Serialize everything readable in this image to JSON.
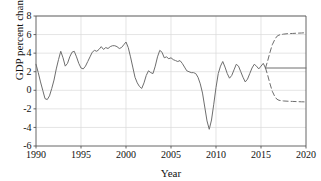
{
  "chart_data": {
    "type": "line",
    "title": "",
    "xlabel": "Year",
    "ylabel": "GDP percent change",
    "xlim": [
      1990,
      2020
    ],
    "ylim": [
      -6,
      8
    ],
    "xticks": [
      1990,
      1995,
      2000,
      2005,
      2010,
      2015,
      2020
    ],
    "yticks": [
      -6,
      -4,
      -2,
      0,
      2,
      4,
      6,
      8
    ],
    "xtick_labels": [
      "1990",
      "1995",
      "2000",
      "2005",
      "2010",
      "2015",
      "2020"
    ],
    "ytick_labels": [
      "-6",
      "-4",
      "-2",
      "0",
      "2",
      "4",
      "6",
      "8"
    ],
    "grid": true,
    "legend": "none",
    "series": [
      {
        "name": "historical-gdp-percent-change",
        "style": "solid",
        "color": "#6e6e6e",
        "x": [
          1990.0,
          1990.25,
          1990.5,
          1990.75,
          1991.0,
          1991.25,
          1991.5,
          1991.75,
          1992.0,
          1992.25,
          1992.5,
          1992.75,
          1993.0,
          1993.25,
          1993.5,
          1993.75,
          1994.0,
          1994.25,
          1994.5,
          1994.75,
          1995.0,
          1995.25,
          1995.5,
          1995.75,
          1996.0,
          1996.25,
          1996.5,
          1996.75,
          1997.0,
          1997.25,
          1997.5,
          1997.75,
          1998.0,
          1998.25,
          1998.5,
          1998.75,
          1999.0,
          1999.25,
          1999.5,
          1999.75,
          2000.0,
          2000.25,
          2000.5,
          2000.75,
          2001.0,
          2001.25,
          2001.5,
          2001.75,
          2002.0,
          2002.25,
          2002.5,
          2002.75,
          2003.0,
          2003.25,
          2003.5,
          2003.75,
          2004.0,
          2004.25,
          2004.5,
          2004.75,
          2005.0,
          2005.25,
          2005.5,
          2005.75,
          2006.0,
          2006.25,
          2006.5,
          2006.75,
          2007.0,
          2007.25,
          2007.5,
          2007.75,
          2008.0,
          2008.25,
          2008.5,
          2008.75,
          2009.0,
          2009.25,
          2009.5,
          2009.75,
          2010.0,
          2010.25,
          2010.5,
          2010.75,
          2011.0,
          2011.25,
          2011.5,
          2011.75,
          2012.0,
          2012.25,
          2012.5,
          2012.75,
          2013.0,
          2013.25,
          2013.5,
          2013.75,
          2014.0,
          2014.25,
          2014.5,
          2014.75,
          2015.0,
          2015.25,
          2015.5
        ],
        "y": [
          2.8,
          1.9,
          0.9,
          0.0,
          -0.9,
          -1.0,
          -0.6,
          0.2,
          1.1,
          2.3,
          3.3,
          4.2,
          3.5,
          2.6,
          2.9,
          3.6,
          4.1,
          4.2,
          3.6,
          2.9,
          2.4,
          2.3,
          2.6,
          3.1,
          3.6,
          4.1,
          4.3,
          4.2,
          4.4,
          4.7,
          4.4,
          4.6,
          4.5,
          4.7,
          4.8,
          4.8,
          4.7,
          4.5,
          4.6,
          4.9,
          5.2,
          4.6,
          3.6,
          2.5,
          1.4,
          0.8,
          0.4,
          0.2,
          0.8,
          1.6,
          2.1,
          1.9,
          1.8,
          2.6,
          3.6,
          4.3,
          4.1,
          3.5,
          3.6,
          3.4,
          3.5,
          3.3,
          3.2,
          3.1,
          3.2,
          2.9,
          2.5,
          2.1,
          2.0,
          1.9,
          1.9,
          1.8,
          1.4,
          0.7,
          -0.3,
          -1.8,
          -3.3,
          -4.2,
          -3.2,
          -1.5,
          0.3,
          1.8,
          2.6,
          3.1,
          2.5,
          1.8,
          1.3,
          1.6,
          2.2,
          2.8,
          2.6,
          2.0,
          1.4,
          0.9,
          1.2,
          1.8,
          2.4,
          2.8,
          2.6,
          2.3,
          2.6,
          2.9,
          2.4
        ]
      },
      {
        "name": "forecast-upper-bound",
        "style": "dashed",
        "color": "#6e6e6e",
        "x": [
          2015.5,
          2015.75,
          2016.0,
          2016.25,
          2016.5,
          2016.75,
          2017.0,
          2017.5,
          2018.0,
          2018.5,
          2019.0,
          2019.5,
          2020.0
        ],
        "y": [
          2.4,
          3.2,
          4.1,
          4.9,
          5.4,
          5.8,
          5.95,
          6.05,
          6.1,
          6.12,
          6.15,
          6.17,
          6.2
        ]
      },
      {
        "name": "forecast-central-projection",
        "style": "solid",
        "color": "#6e6e6e",
        "x": [
          2015.5,
          2016.0,
          2017.0,
          2018.0,
          2019.0,
          2020.0
        ],
        "y": [
          2.4,
          2.4,
          2.4,
          2.4,
          2.4,
          2.4
        ]
      },
      {
        "name": "forecast-lower-bound",
        "style": "dashed",
        "color": "#6e6e6e",
        "x": [
          2015.5,
          2015.75,
          2016.0,
          2016.25,
          2016.5,
          2016.75,
          2017.0,
          2017.5,
          2018.0,
          2018.5,
          2019.0,
          2019.5,
          2020.0
        ],
        "y": [
          2.4,
          1.6,
          0.7,
          -0.1,
          -0.6,
          -0.95,
          -1.08,
          -1.15,
          -1.18,
          -1.2,
          -1.22,
          -1.24,
          -1.25
        ]
      }
    ]
  },
  "axes": {
    "xlabel": "Year",
    "ylabel": "GDP percent change"
  }
}
